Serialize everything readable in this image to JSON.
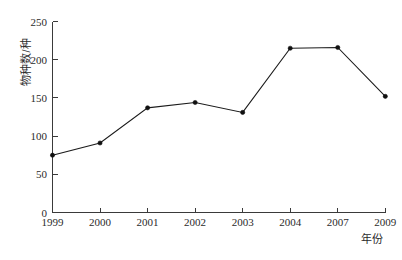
{
  "chart_data": {
    "type": "line",
    "title": "",
    "subtitle": "",
    "xlabel": "年份",
    "ylabel": "物种数/种",
    "categories": [
      "1999",
      "2000",
      "2001",
      "2002",
      "2003",
      "2004",
      "2007",
      "2009"
    ],
    "values": [
      75,
      91,
      137,
      144,
      131,
      215,
      216,
      152
    ],
    "series": [
      {
        "name": "物种数",
        "values": [
          75,
          91,
          137,
          144,
          131,
          215,
          216,
          152
        ]
      }
    ],
    "ylim": [
      0,
      250
    ],
    "yticks": [
      0,
      50,
      100,
      150,
      200,
      250
    ],
    "ytick_labels": [
      "0",
      "50",
      "100",
      "150",
      "200",
      "250"
    ],
    "xtick_labels": [
      "1999",
      "2000",
      "2001",
      "2002",
      "2003",
      "2004",
      "2007",
      "2009"
    ],
    "grid": false,
    "legend": false,
    "legend_position": "none",
    "marker": "filled-dot",
    "line_color": "#1b1b1b",
    "marker_color": "#101010",
    "background_color": "#ffffff",
    "axis_color": "#3a3a3a"
  },
  "axes": {
    "y_title": "物种数/种",
    "x_title": "年份"
  }
}
